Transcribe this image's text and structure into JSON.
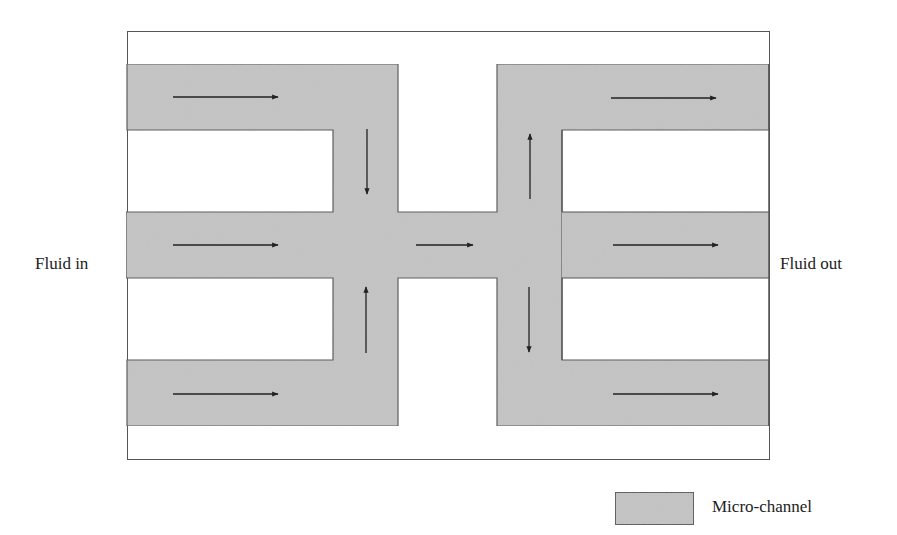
{
  "labels": {
    "inlet": "Fluid in",
    "outlet": "Fluid out"
  },
  "legend": {
    "items": [
      {
        "label": "Micro-channel",
        "swatch_color": "#c4c4c4"
      }
    ]
  },
  "colors": {
    "channel_fill": "#c4c4c4",
    "outline": "#555555",
    "arrow": "#222222",
    "background": "#ffffff"
  },
  "flow_arrows": [
    {
      "region": "top-left channel",
      "direction": "right"
    },
    {
      "region": "left-top stem",
      "direction": "down"
    },
    {
      "region": "inlet channel",
      "direction": "right"
    },
    {
      "region": "left-bottom stem",
      "direction": "up"
    },
    {
      "region": "bottom-left channel",
      "direction": "right"
    },
    {
      "region": "center connector",
      "direction": "right"
    },
    {
      "region": "right-top stem",
      "direction": "up"
    },
    {
      "region": "top-right channel",
      "direction": "right"
    },
    {
      "region": "outlet channel",
      "direction": "right"
    },
    {
      "region": "right-bottom stem",
      "direction": "down"
    },
    {
      "region": "bottom-right channel",
      "direction": "right"
    }
  ]
}
